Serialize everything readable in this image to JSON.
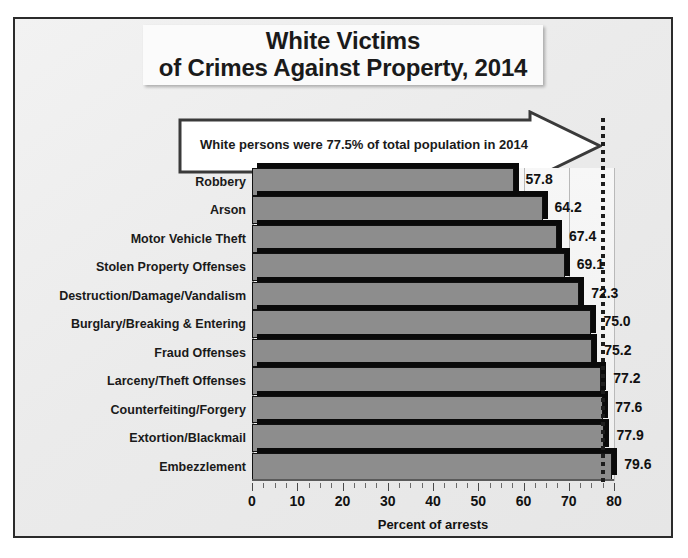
{
  "title": {
    "line1": "White Victims",
    "line2": "of Crimes Against Property, 2014"
  },
  "callout": {
    "text": "White persons were 77.5% of total population in 2014",
    "reference_value": 77.5
  },
  "colors": {
    "bar_face": "#8d8d8d",
    "bar_shadow": "#0a0a0a",
    "frame": "#2b2b2b",
    "background": "#ececec",
    "plot_background": "#f6f6f6",
    "refline": "#1d1d1d",
    "text": "#1a1a1a"
  },
  "chart_data": {
    "type": "bar",
    "orientation": "horizontal",
    "title": "White Victims of Crimes Against Property, 2014",
    "xlabel": "Percent of arrests",
    "ylabel": "",
    "xlim": [
      0,
      80
    ],
    "xticks": [
      0,
      10,
      20,
      30,
      40,
      50,
      60,
      70,
      80
    ],
    "xtick_labels": [
      "0",
      "10",
      "20",
      "30",
      "40",
      "50",
      "60",
      "70",
      "80"
    ],
    "minor_tick_step": 2.5,
    "grid": true,
    "legend": null,
    "categories": [
      "Robbery",
      "Arson",
      "Motor Vehicle Theft",
      "Stolen Property Offenses",
      "Destruction/Damage/Vandalism",
      "Burglary/Breaking & Entering",
      "Fraud Offenses",
      "Larceny/Theft Offenses",
      "Counterfeiting/Forgery",
      "Extortion/Blackmail",
      "Embezzlement"
    ],
    "values": [
      57.8,
      64.2,
      67.4,
      69.1,
      72.3,
      75.0,
      75.2,
      77.2,
      77.6,
      77.9,
      79.6
    ],
    "value_labels": [
      "57.8",
      "64.2",
      "67.4",
      "69.1",
      "72.3",
      "75.0",
      "75.2",
      "77.2",
      "77.6",
      "77.9",
      "79.6"
    ],
    "annotations": [
      {
        "type": "reference-line",
        "value": 77.5,
        "style": "dotted",
        "label": "White persons were 77.5% of total population in 2014"
      }
    ]
  }
}
